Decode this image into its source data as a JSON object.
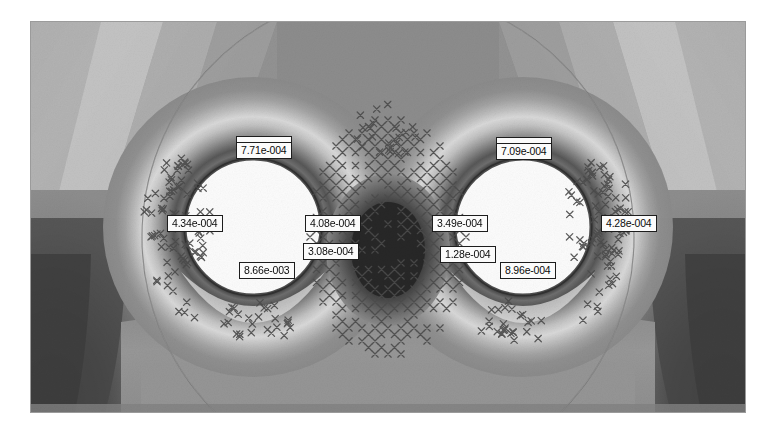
{
  "figure": {
    "kind": "fem-contour-plot",
    "frame": {
      "x": 31,
      "y": 22,
      "width": 714,
      "height": 390
    },
    "background_color": "#ffffff",
    "plot_base_color": "#8e8e8e"
  },
  "contour_labels": [
    {
      "id": "left-crown",
      "text": "7.71e-004",
      "x": 236,
      "y": 142,
      "leader": true
    },
    {
      "id": "left-springline-west",
      "text": "4.34e-004",
      "x": 167,
      "y": 215,
      "leader": false
    },
    {
      "id": "left-invert",
      "text": "8.66e-003",
      "x": 239,
      "y": 262,
      "leader": false
    },
    {
      "id": "pillar-upper",
      "text": "4.08e-004",
      "x": 305,
      "y": 215,
      "leader": false
    },
    {
      "id": "pillar-lower",
      "text": "3.08e-004",
      "x": 303,
      "y": 243,
      "leader": false
    },
    {
      "id": "right-springline-west",
      "text": "3.49e-004",
      "x": 432,
      "y": 215,
      "leader": false
    },
    {
      "id": "right-invert-west",
      "text": "1.28e-004",
      "x": 440,
      "y": 246,
      "leader": false
    },
    {
      "id": "right-crown",
      "text": "7.09e-004",
      "x": 496,
      "y": 143,
      "leader": true
    },
    {
      "id": "right-springline-east",
      "text": "4.28e-004",
      "x": 601,
      "y": 215,
      "leader": false
    },
    {
      "id": "right-invert",
      "text": "8.96e-004",
      "x": 500,
      "y": 262,
      "leader": false
    }
  ],
  "chart_data": {
    "type": "heatmap",
    "title": "",
    "xlabel": "",
    "ylabel": "",
    "grid": false,
    "legend_position": "none",
    "colormap": "grayscale-banded",
    "band_colors": [
      "#f2f2f2",
      "#e2e2e2",
      "#d2d2d2",
      "#c2c2c2",
      "#b2b2b2",
      "#a2a2a2",
      "#949494",
      "#868686",
      "#787878",
      "#6a6a6a",
      "#5c5c5c",
      "#4e4e4e",
      "#424242",
      "#363636",
      "#2c2c2c"
    ],
    "annotations": [
      "7.71e-004",
      "4.34e-004",
      "8.66e-003",
      "4.08e-004",
      "3.08e-004",
      "3.49e-004",
      "1.28e-004",
      "7.09e-004",
      "4.28e-004",
      "8.96e-004"
    ],
    "annotation_values": [
      0.000771,
      0.000434,
      0.00866,
      0.000408,
      0.000308,
      0.000349,
      0.000128,
      0.000709,
      0.000428,
      0.000896
    ],
    "value_min": 0.000128,
    "value_max": 0.00866,
    "features": [
      {
        "name": "left-tunnel",
        "shape": "circle",
        "cx": 222,
        "cy": 205,
        "r": 68,
        "fill": "#fdfdfd"
      },
      {
        "name": "right-tunnel",
        "shape": "circle",
        "cx": 492,
        "cy": 205,
        "r": 68,
        "fill": "#fdfdfd"
      },
      {
        "name": "pillar-core",
        "shape": "ellipse",
        "cx": 357,
        "cy": 228,
        "rx": 37,
        "ry": 48,
        "fill": "#2b2b2b"
      },
      {
        "name": "excavation-boundary-circle",
        "shape": "arc",
        "cx": 357,
        "cy": 215,
        "r": 246
      }
    ],
    "marker_symbol": "x",
    "marker_meaning": "plastic-yield-point",
    "marker_color": "#4a4a4a"
  }
}
